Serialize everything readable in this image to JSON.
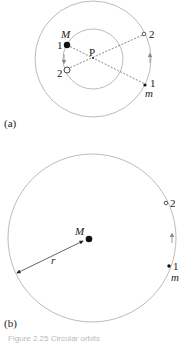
{
  "figure_a": {
    "label": "(a)",
    "center_label": "P",
    "large_mass_label": "M",
    "small_mass_label": "m",
    "M_pos1_label": "1",
    "M_pos2_label": "2",
    "m_pos1_label": "1",
    "m_pos2_label": "2"
  },
  "figure_b": {
    "label": "(b)",
    "mass_label": "M",
    "radius_label": "r",
    "small_mass_label": "m",
    "pos1_label": "1",
    "pos2_label": "2"
  },
  "caption": "Figure 2.25  Circular orbits"
}
